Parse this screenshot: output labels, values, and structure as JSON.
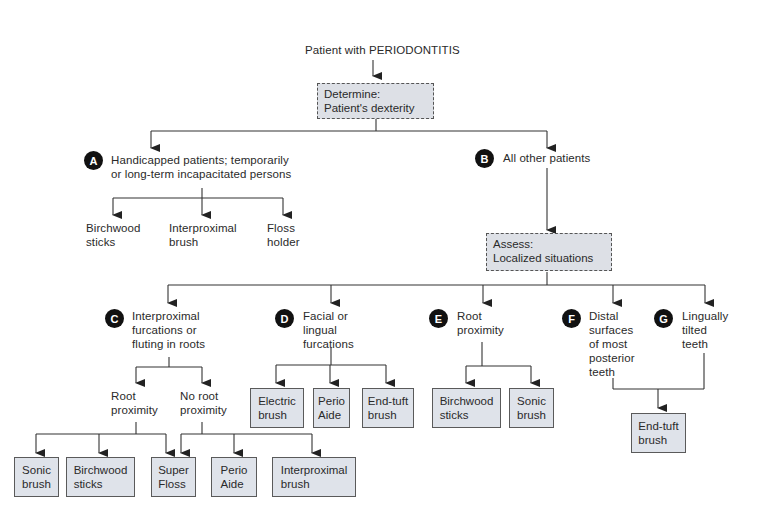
{
  "root": {
    "label": "Patient with PERIODONTITIS"
  },
  "determine": {
    "label": "Determine:\n  Patient's dexterity"
  },
  "assess": {
    "label": "Assess:\n  Localized situations"
  },
  "nodes": {
    "A": {
      "badge": "A",
      "label": "Handicapped patients; temporarily\nor long-term incapacitated persons"
    },
    "B": {
      "badge": "B",
      "label": "All other patients"
    },
    "C": {
      "badge": "C",
      "label": "Interproximal\nfurcations or\nfluting in roots"
    },
    "D": {
      "badge": "D",
      "label": "Facial or\nlingual\nfurcations"
    },
    "E": {
      "badge": "E",
      "label": "Root\nproximity"
    },
    "F": {
      "badge": "F",
      "label": "Distal\nsurfaces\nof most\nposterior\nteeth"
    },
    "G": {
      "badge": "G",
      "label": "Lingually\ntilted\nteeth"
    }
  },
  "a_options": [
    "Birchwood\nsticks",
    "Interproximal\nbrush",
    "Floss\nholder"
  ],
  "c_sub": {
    "root_proximity": "Root\nproximity",
    "no_root_proximity": "No root\nproximity"
  },
  "c_options": [
    "Sonic\nbrush",
    "Birchwood\nsticks",
    "Super\nFloss",
    "Perio\nAide",
    "Interproximal\nbrush"
  ],
  "d_options": [
    "Electric\nbrush",
    "Perio\nAide",
    "End-tuft\nbrush"
  ],
  "e_options": [
    "Birchwood\nsticks",
    "Sonic\nbrush"
  ],
  "fg_options": [
    "End-tuft\nbrush"
  ]
}
